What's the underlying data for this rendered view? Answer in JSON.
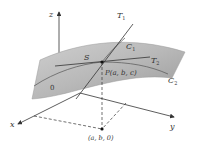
{
  "diagram": {
    "labels": {
      "z_axis": "z",
      "x_axis": "x",
      "y_axis": "y",
      "origin": "0",
      "surface": "S",
      "tangent1": "T",
      "tangent1_sub": "1",
      "tangent2": "T",
      "tangent2_sub": "2",
      "curve1": "C",
      "curve1_sub": "1",
      "curve2": "C",
      "curve2_sub": "2",
      "point_p": "P(a, b, c)",
      "point_proj": "(a, b, 0)"
    },
    "colors": {
      "surface_light": "#d4d4d4",
      "surface_dark": "#9a9a9a",
      "lines": "#333333",
      "background": "#ffffff"
    }
  }
}
